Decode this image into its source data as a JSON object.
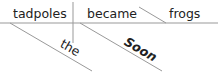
{
  "diagram": {
    "type": "sentence-diagram",
    "sentence": "Soon the tadpoles became frogs",
    "subject": "tadpoles",
    "verb": "became",
    "complement": "frogs",
    "modifiers": [
      {
        "word": "the",
        "modifies": "tadpoles"
      },
      {
        "word": "Soon",
        "modifies": "became"
      }
    ],
    "colors": {
      "line": "#999999",
      "text": "#222222"
    }
  }
}
